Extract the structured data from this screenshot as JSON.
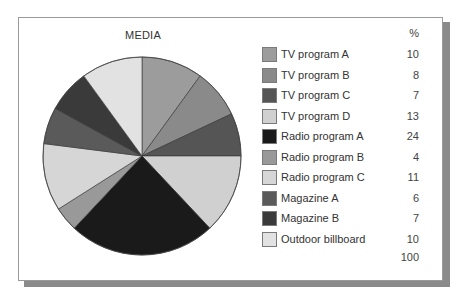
{
  "chart_data": {
    "type": "pie",
    "title": "MEDIA",
    "value_header": "%",
    "categories": [
      "TV program A",
      "TV program B",
      "TV program C",
      "TV program D",
      "Radio program A",
      "Radio program B",
      "Radio program C",
      "Magazine A",
      "Magazine B",
      "Outdoor billboard"
    ],
    "values": [
      10,
      8,
      7,
      13,
      24,
      4,
      11,
      6,
      7,
      10
    ],
    "colors": [
      "#9c9c9c",
      "#8a8a8a",
      "#555555",
      "#d0d0d0",
      "#1a1a1a",
      "#999999",
      "#d6d6d6",
      "#5a5a5a",
      "#3a3a3a",
      "#e2e2e2"
    ],
    "total": 100,
    "start_angle": "12 o'clock, clockwise",
    "legend_position": "right"
  },
  "chart": {
    "title": "MEDIA",
    "pct_header": "%",
    "total_label": "100",
    "items": [
      {
        "label": "TV program A",
        "value": "10"
      },
      {
        "label": "TV program B",
        "value": "8"
      },
      {
        "label": "TV program C",
        "value": "7"
      },
      {
        "label": "TV program D",
        "value": "13"
      },
      {
        "label": "Radio program A",
        "value": "24"
      },
      {
        "label": "Radio program B",
        "value": "4"
      },
      {
        "label": "Radio program C",
        "value": "11"
      },
      {
        "label": "Magazine A",
        "value": "6"
      },
      {
        "label": "Magazine B",
        "value": "7"
      },
      {
        "label": "Outdoor billboard",
        "value": "10"
      }
    ]
  }
}
